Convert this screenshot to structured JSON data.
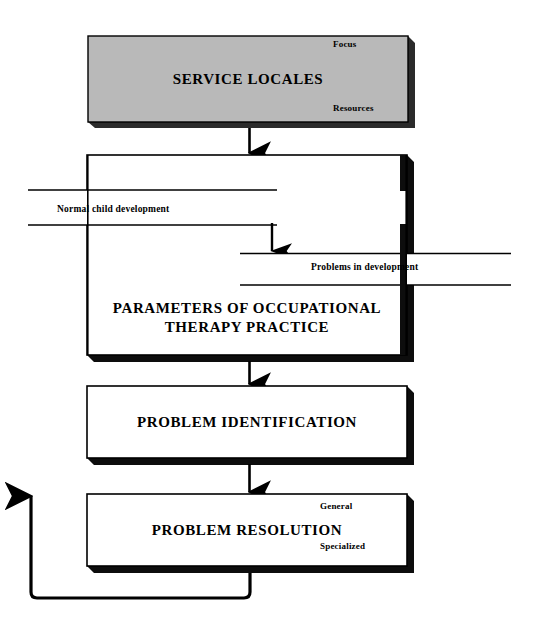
{
  "diagram": {
    "type": "flowchart",
    "title_text": "Occupational therapy practice flow",
    "colors": {
      "box_fill_gray": "#b9b9b9",
      "box_fill_white": "#ffffff",
      "stroke": "#000000",
      "shadow": "#111111",
      "background": "#ffffff"
    },
    "nodes": [
      {
        "id": "service-locales",
        "label": "SERVICE LOCALES",
        "fill": "gray",
        "corner_labels": [
          {
            "id": "focus",
            "text": "Focus",
            "position": "top-right"
          },
          {
            "id": "resources",
            "text": "Resources",
            "position": "bottom-right"
          }
        ]
      },
      {
        "id": "parameters",
        "label": "PARAMETERS OF OCCUPATIONAL\nTHERAPY PRACTICE",
        "fill": "white",
        "corner_labels": []
      },
      {
        "id": "problem-identification",
        "label": "PROBLEM IDENTIFICATION",
        "fill": "white",
        "corner_labels": []
      },
      {
        "id": "problem-resolution",
        "label": "PROBLEM RESOLUTION",
        "fill": "white",
        "corner_labels": [
          {
            "id": "general",
            "text": "General",
            "position": "top-right"
          },
          {
            "id": "specialized",
            "text": "Specialized",
            "position": "bottom-right"
          }
        ]
      }
    ],
    "bands": [
      {
        "id": "normal-child-development",
        "label": "Normal child development",
        "side": "left"
      },
      {
        "id": "problems-in-development",
        "label": "Problems in development",
        "side": "right"
      }
    ],
    "connectors": [
      {
        "id": "arrow-service-to-parameters",
        "from": "service-locales",
        "to": "parameters",
        "direction": "down"
      },
      {
        "id": "arrow-band-into-parameters",
        "from": "normal-child-development",
        "to": "problems-in-development",
        "direction": "down"
      },
      {
        "id": "arrow-parameters-to-identification",
        "from": "parameters",
        "to": "problem-identification",
        "direction": "down"
      },
      {
        "id": "arrow-identification-to-resolution",
        "from": "problem-identification",
        "to": "problem-resolution",
        "direction": "down"
      },
      {
        "id": "feedback-loop",
        "from": "problem-resolution",
        "to": "problem-resolution",
        "direction": "up",
        "style": "loop-left"
      }
    ]
  }
}
